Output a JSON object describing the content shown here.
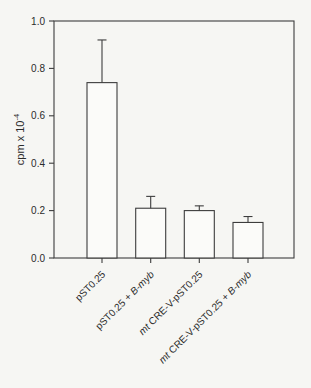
{
  "window": {
    "width": 311,
    "height": 388
  },
  "palette": {
    "background": "#f6f6f3",
    "line": "#3d3d3d",
    "text": "#2b2b2b",
    "bar_fill": "#fbfbf9"
  },
  "chart_data": {
    "type": "bar",
    "title": "",
    "xlabel": "",
    "ylabel": "cpm x 10",
    "ylabel_superscript": "-4",
    "ylabel_full": "cpm x 10^-4",
    "ylim": [
      0.0,
      1.0
    ],
    "ytick_step": 0.2,
    "ytick_labels": [
      "0.0",
      "0.2",
      "0.4",
      "0.6",
      "0.8",
      "1.0"
    ],
    "grid": false,
    "legend": "none",
    "frame": "box",
    "x_tick_rotation_deg": 45,
    "category_labels": [
      "pST0.25",
      "pST0.25 + B-myb",
      "mt CRE-V-pST0.25",
      "mt CRE-V-pST0.25 + B-myb"
    ],
    "categories_rich": [
      {
        "parts": [
          {
            "text": "pST0.25",
            "italic": false
          }
        ]
      },
      {
        "parts": [
          {
            "text": "pST0.25 + ",
            "italic": false
          },
          {
            "text": "B-myb",
            "italic": true
          }
        ]
      },
      {
        "parts": [
          {
            "text": "mt",
            "italic": true
          },
          {
            "text": " CRE-V-pST0.25",
            "italic": false
          }
        ]
      },
      {
        "parts": [
          {
            "text": "mt",
            "italic": true
          },
          {
            "text": " CRE-V-pST0.25 + ",
            "italic": false
          },
          {
            "text": "B-myb",
            "italic": true
          }
        ]
      }
    ],
    "values": [
      0.74,
      0.21,
      0.2,
      0.15
    ],
    "errors_upper": [
      0.18,
      0.05,
      0.02,
      0.025
    ],
    "error_caps": true
  }
}
